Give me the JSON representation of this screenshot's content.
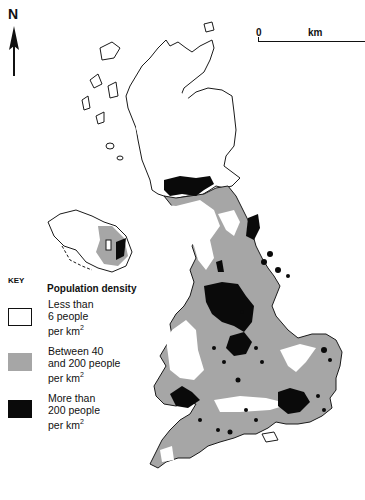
{
  "map": {
    "subject": "Population density of the United Kingdom",
    "north_arrow": {
      "label": "N"
    },
    "scale_bar": {
      "start_label": "0",
      "unit_label": "km"
    },
    "colors": {
      "land_low": "#ffffff",
      "land_mid": "#a6a6a6",
      "land_high": "#0a0a0a",
      "outline": "#1a1a1a"
    }
  },
  "legend": {
    "key_label": "KEY",
    "title": "Population density",
    "items": [
      {
        "label_line1": "Less than",
        "label_line2": "6 people",
        "label_line3": "per km",
        "sup": "2",
        "color": "#ffffff"
      },
      {
        "label_line1": "Between 40",
        "label_line2": "and 200 people",
        "label_line3": "per km",
        "sup": "2",
        "color": "#a6a6a6"
      },
      {
        "label_line1": "More than",
        "label_line2": "200 people",
        "label_line3": "per km",
        "sup": "2",
        "color": "#0a0a0a"
      }
    ]
  }
}
